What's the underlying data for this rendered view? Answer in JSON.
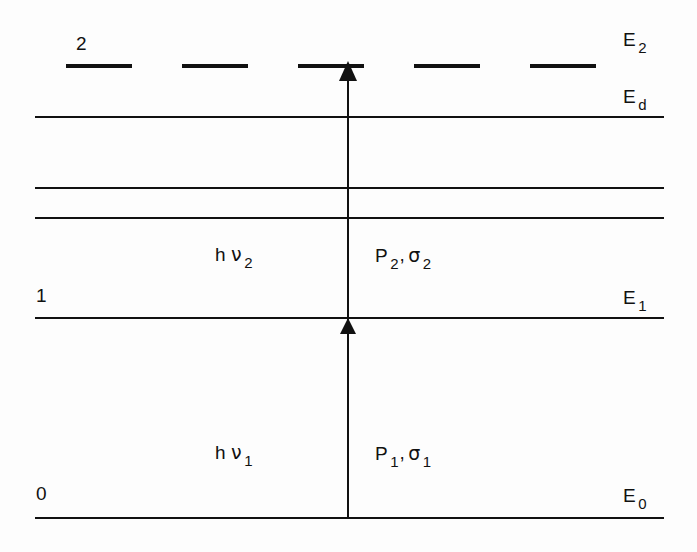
{
  "figure": {
    "type": "energy-level-diagram",
    "background_color": "#fdfdfd",
    "ink_color": "#111111",
    "width": 697,
    "height": 552
  },
  "levels": [
    {
      "id": "E2",
      "style": "dashed",
      "left_index_label": "2",
      "right_energy_label": "E",
      "right_energy_sub": "2",
      "y": 66,
      "x_start": 66,
      "x_end": 645
    },
    {
      "id": "Ed",
      "style": "solid",
      "left_index_label": "",
      "right_energy_label": "E",
      "right_energy_sub": "d",
      "y": 117,
      "x_start": 35,
      "x_end": 664
    },
    {
      "id": "unlabeled-upper",
      "style": "solid",
      "left_index_label": "",
      "right_energy_label": "",
      "right_energy_sub": "",
      "y": 188,
      "x_start": 35,
      "x_end": 664
    },
    {
      "id": "unlabeled-lower",
      "style": "solid",
      "left_index_label": "",
      "right_energy_label": "",
      "right_energy_sub": "",
      "y": 218,
      "x_start": 35,
      "x_end": 664
    },
    {
      "id": "E1",
      "style": "solid",
      "left_index_label": "1",
      "right_energy_label": "E",
      "right_energy_sub": "1",
      "y": 318,
      "x_start": 35,
      "x_end": 664
    },
    {
      "id": "E0",
      "style": "solid",
      "left_index_label": "0",
      "right_energy_label": "E",
      "right_energy_sub": "0",
      "y": 518,
      "x_start": 35,
      "x_end": 664
    }
  ],
  "transitions": [
    {
      "id": "step-1",
      "photon_label": "h",
      "photon_symbol": "ν",
      "photon_sub": "1",
      "power_label": "P",
      "power_sub": "1",
      "cross_section_symbol": "σ",
      "cross_section_sub": "1",
      "from_level": "E0",
      "to_level": "E1",
      "arrow_x": 348
    },
    {
      "id": "step-2",
      "photon_label": "h",
      "photon_symbol": "ν",
      "photon_sub": "2",
      "power_label": "P",
      "power_sub": "2",
      "cross_section_symbol": "σ",
      "cross_section_sub": "2",
      "from_level": "E1",
      "to_level": "E2",
      "arrow_x": 348
    }
  ],
  "separators": {
    "comma": ","
  }
}
